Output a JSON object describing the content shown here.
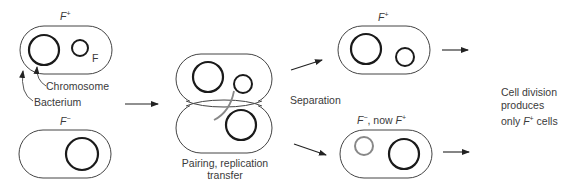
{
  "diagram": {
    "colors": {
      "outline": "#444444",
      "chromosome": "#1a1a1a",
      "new_plasmid": "#888888",
      "arrow": "#222222",
      "text": "#3a3a3a"
    },
    "donor_cell": {
      "label_main": "F",
      "label_sup": "+",
      "plasmid_label": "F",
      "chromosome_label": "Chromosome",
      "bacterium_label": "Bacterium"
    },
    "recipient_cell": {
      "label_main": "F",
      "label_sup": "−"
    },
    "pairing": {
      "caption_line1": "Pairing, replication",
      "caption_line2": "transfer"
    },
    "separation_label": "Separation",
    "result_top": {
      "label_main": "F",
      "label_sup": "+"
    },
    "result_bottom": {
      "label_prefix": "F",
      "label_prefix_sup": "−",
      "label_middle": ", now ",
      "label_suffix": "F",
      "label_suffix_sup": "+"
    },
    "outcome": {
      "line1": "Cell division",
      "line2": "produces",
      "line3_prefix": "only ",
      "line3_f": "F",
      "line3_sup": "+",
      "line3_suffix": " cells"
    }
  }
}
